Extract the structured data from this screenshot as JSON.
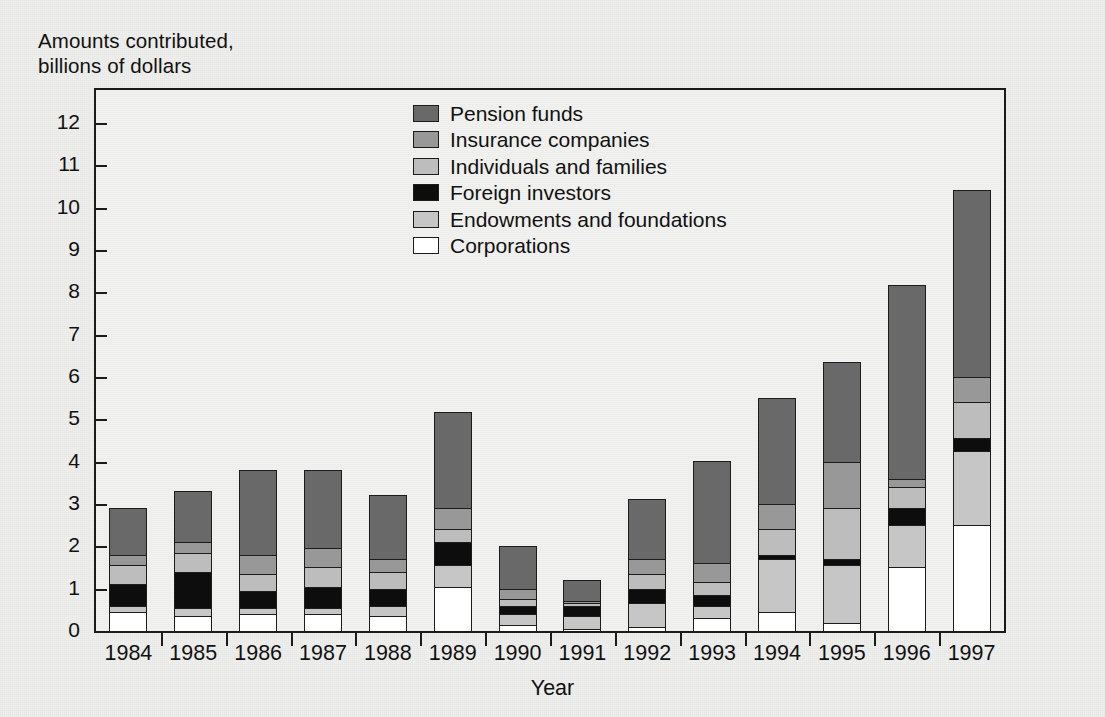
{
  "chart_data": {
    "type": "bar",
    "stacked": true,
    "title": "Amounts contributed,\nbillions of dollars",
    "xlabel": "Year",
    "ylabel": "Amounts contributed, billions of dollars",
    "ylim": [
      0,
      12
    ],
    "yticks": [
      0,
      1,
      2,
      3,
      4,
      5,
      6,
      7,
      8,
      9,
      10,
      11,
      12
    ],
    "ytick_labels": [
      "0",
      "1",
      "2",
      "3",
      "4",
      "5",
      "6",
      "7",
      "8",
      "9",
      "10",
      "11",
      "12"
    ],
    "grid": false,
    "legend_position": "upper center inside",
    "categories": [
      "1984",
      "1985",
      "1986",
      "1987",
      "1988",
      "1989",
      "1990",
      "1991",
      "1992",
      "1993",
      "1994",
      "1995",
      "1996",
      "1997"
    ],
    "stack_order_bottom_to_top": [
      "Corporations",
      "Endowments and foundations",
      "Foreign investors",
      "Individuals and families",
      "Insurance companies",
      "Pension funds"
    ],
    "series": [
      {
        "name": "Corporations",
        "color": "#ffffff",
        "values": [
          0.45,
          0.35,
          0.4,
          0.4,
          0.35,
          1.05,
          0.15,
          0.05,
          0.1,
          0.3,
          0.45,
          0.2,
          1.5,
          2.5
        ]
      },
      {
        "name": "Endowments and foundations",
        "color": "#c6c6c6",
        "values": [
          0.15,
          0.2,
          0.15,
          0.15,
          0.25,
          0.5,
          0.25,
          0.3,
          0.55,
          0.3,
          1.25,
          1.35,
          1.0,
          1.75
        ]
      },
      {
        "name": "Foreign investors",
        "color": "#0d0d0d",
        "values": [
          0.5,
          0.85,
          0.4,
          0.5,
          0.4,
          0.55,
          0.2,
          0.25,
          0.35,
          0.25,
          0.1,
          0.15,
          0.4,
          0.3
        ]
      },
      {
        "name": "Individuals and families",
        "color": "#bdbdbd",
        "values": [
          0.45,
          0.45,
          0.4,
          0.45,
          0.4,
          0.3,
          0.15,
          0.05,
          0.35,
          0.3,
          0.6,
          1.2,
          0.5,
          0.85
        ]
      },
      {
        "name": "Insurance companies",
        "color": "#989898",
        "values": [
          0.25,
          0.25,
          0.45,
          0.45,
          0.3,
          0.5,
          0.25,
          0.05,
          0.35,
          0.45,
          0.6,
          1.1,
          0.2,
          0.6
        ]
      },
      {
        "name": "Pension funds",
        "color": "#696969",
        "values": [
          1.1,
          1.2,
          2.0,
          1.85,
          1.5,
          2.25,
          1.0,
          0.5,
          1.4,
          2.4,
          2.5,
          2.35,
          4.55,
          4.4
        ]
      }
    ],
    "totals": [
      2.9,
      3.3,
      3.8,
      3.8,
      3.2,
      5.15,
      2.0,
      1.2,
      3.1,
      4.0,
      5.5,
      6.35,
      8.15,
      10.4
    ]
  },
  "legend": {
    "items": [
      {
        "label": "Pension funds",
        "color": "#696969"
      },
      {
        "label": "Insurance companies",
        "color": "#989898"
      },
      {
        "label": "Individuals and families",
        "color": "#bdbdbd"
      },
      {
        "label": "Foreign investors",
        "color": "#0d0d0d"
      },
      {
        "label": "Endowments and foundations",
        "color": "#c6c6c6"
      },
      {
        "label": "Corporations",
        "color": "#ffffff"
      }
    ]
  },
  "axes": {
    "y_title": "Amounts contributed,\nbillions of dollars",
    "x_title": "Year"
  }
}
